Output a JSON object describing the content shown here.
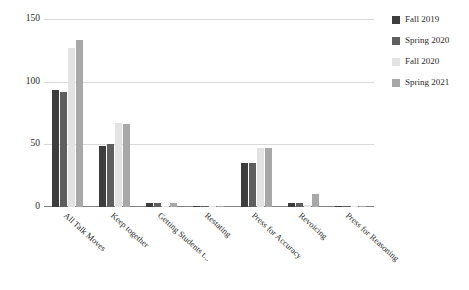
{
  "chart_data": {
    "type": "bar",
    "title": "",
    "xlabel": "",
    "ylabel": "",
    "ylim": [
      0,
      150
    ],
    "yticks": [
      0,
      50,
      100,
      150
    ],
    "grid": true,
    "legend_position": "right",
    "categories": [
      "All Talk Moves",
      "Keep together",
      "Getting Students t...",
      "Restating",
      "Press for Accuracy",
      "Revoicing",
      "Press for Reasoning"
    ],
    "series": [
      {
        "name": "Fall 2019",
        "color": "#3d3d3d",
        "values": [
          93,
          49,
          3,
          0,
          35,
          3,
          1
        ]
      },
      {
        "name": "Spring 2020",
        "color": "#5e5e5e",
        "values": [
          92,
          50,
          3,
          1,
          35,
          3,
          1
        ]
      },
      {
        "name": "Fall 2020",
        "color": "#e3e3e3",
        "values": [
          127,
          67,
          1,
          0,
          47,
          2,
          1
        ]
      },
      {
        "name": "Spring 2021",
        "color": "#a8a8a8",
        "values": [
          133,
          66,
          3,
          1,
          47,
          10,
          1
        ]
      }
    ]
  },
  "axis": {
    "ytick_labels": [
      "150",
      "100",
      "50",
      "0"
    ]
  },
  "legend": {
    "items": [
      {
        "label": "Fall 2019",
        "color": "#3d3d3d"
      },
      {
        "label": "Spring 2020",
        "color": "#5e5e5e"
      },
      {
        "label": "Fall 2020",
        "color": "#e3e3e3"
      },
      {
        "label": "Spring 2021",
        "color": "#a8a8a8"
      }
    ]
  },
  "colors": {
    "gridline": "#d9d9d9",
    "axis": "#808080",
    "text": "#2b2b2b",
    "background": "#ffffff"
  }
}
